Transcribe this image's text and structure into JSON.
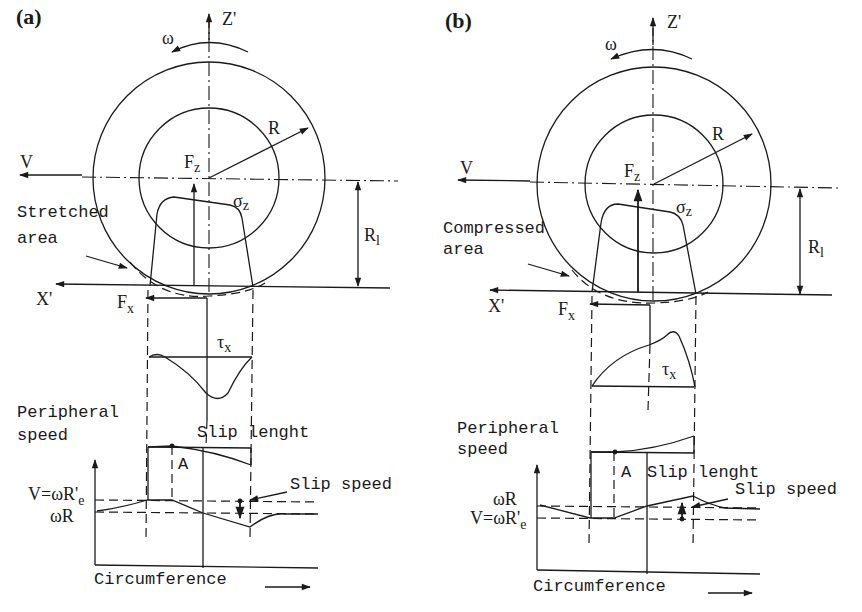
{
  "figure": {
    "panels": [
      {
        "id": "a",
        "label": "(a)",
        "axis_z": "Z'",
        "axis_x": "X'",
        "omega": "ω",
        "radius": "R",
        "velocity": "V",
        "normal_force": "F",
        "normal_force_sub": "z",
        "normal_stress": "σ",
        "normal_stress_sub": "z",
        "loaded_radius": "R",
        "loaded_radius_sub": "l",
        "area_label_line1": "Stretched",
        "area_label_line2": "area",
        "long_force": "F",
        "long_force_sub": "x",
        "shear_stress": "τ",
        "shear_stress_sub": "x",
        "peripheral_line1": "Peripheral",
        "peripheral_line2": "speed",
        "slip_length": "Slip lenght",
        "point_A": "A",
        "slip_speed": "Slip speed",
        "level_upper": "V=ωR'",
        "level_upper_sub": "e",
        "level_lower": "ωR",
        "x_axis_label": "Circumference"
      },
      {
        "id": "b",
        "label": "(b)",
        "axis_z": "Z'",
        "axis_x": "X'",
        "omega": "ω",
        "radius": "R",
        "velocity": "V",
        "normal_force": "F",
        "normal_force_sub": "z",
        "normal_stress": "σ",
        "normal_stress_sub": "z",
        "loaded_radius": "R",
        "loaded_radius_sub": "l",
        "area_label_line1": "Compressed",
        "area_label_line2": "area",
        "long_force": "F",
        "long_force_sub": "x",
        "shear_stress": "τ",
        "shear_stress_sub": "x",
        "peripheral_line1": "Peripheral",
        "peripheral_line2": "speed",
        "slip_length": "Slip lenght",
        "point_A": "A",
        "slip_speed": "Slip speed",
        "level_upper": "ωR",
        "level_lower": "V=ωR'",
        "level_lower_sub": "e",
        "x_axis_label": "Circumference"
      }
    ]
  },
  "colors": {
    "ink": "#1a1a1a",
    "background": "#ffffff"
  }
}
